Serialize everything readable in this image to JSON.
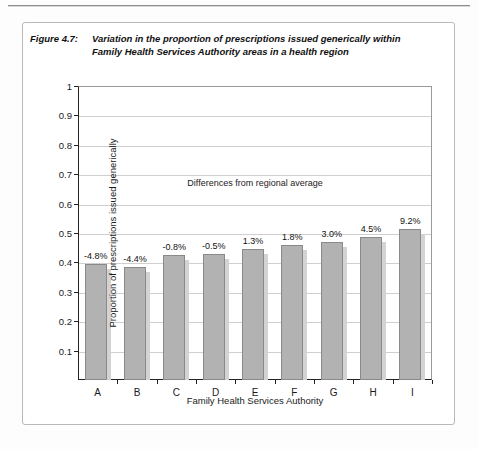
{
  "figure": {
    "number": "Figure 4.7:",
    "title_line1": "Variation in the proportion of prescriptions issued generically within",
    "title_line2": "Family Health Services Authority areas in a health region"
  },
  "chart_data": {
    "type": "bar",
    "title": "Variation in the proportion of prescriptions issued generically within Family Health Services Authority areas in a health region",
    "xlabel": "Family Health Services Authority",
    "ylabel": "Proportion of prescriptions issued generically",
    "categories": [
      "A",
      "B",
      "C",
      "D",
      "E",
      "F",
      "G",
      "H",
      "I"
    ],
    "values": [
      0.395,
      0.385,
      0.425,
      0.43,
      0.445,
      0.46,
      0.47,
      0.485,
      0.515
    ],
    "data_labels": [
      "-4.8%",
      "-4.4%",
      "-0.8%",
      "-0.5%",
      "1.3%",
      "1.8%",
      "3.0%",
      "4.5%",
      "9.2%"
    ],
    "ylim": [
      0,
      1
    ],
    "yticks": [
      0.1,
      0.2,
      0.3,
      0.4,
      0.5,
      0.6,
      0.7,
      0.8,
      0.9,
      1
    ],
    "ytick_labels": [
      "0.1",
      "0.2",
      "0.3",
      "0.4",
      "0.5",
      "0.6",
      "0.7",
      "0.8",
      "0.9",
      "1"
    ],
    "grid": true,
    "legend": "none",
    "annotation": "Differences from regional average",
    "bar_color": "#b2b2b2",
    "bar_edge_color": "#8a8a8a",
    "bar_shadow_color": "#d3d3d3"
  }
}
